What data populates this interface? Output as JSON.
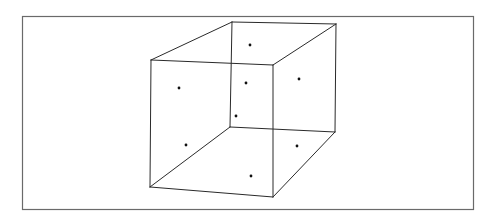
{
  "figure": {
    "colors": {
      "background": "#ffffff",
      "frame_stroke": "#6a6a6a",
      "edge_stroke": "#2a2a2a",
      "dot_fill": "#111111"
    },
    "frame": {
      "x": 22,
      "y": 16,
      "width": 451,
      "height": 193
    },
    "vertices": {
      "front_top_left": [
        151,
        60
      ],
      "front_top_right": [
        273,
        65
      ],
      "front_bottom_right": [
        273,
        197
      ],
      "front_bottom_left": [
        150,
        187
      ],
      "back_top_left": [
        232,
        22
      ],
      "back_top_right": [
        336,
        24
      ],
      "back_bottom_right": [
        335,
        132
      ],
      "back_bottom_left": [
        230,
        127
      ]
    },
    "edges": [
      [
        "front_top_left",
        "front_top_right"
      ],
      [
        "front_top_right",
        "front_bottom_right"
      ],
      [
        "front_bottom_right",
        "front_bottom_left"
      ],
      [
        "front_bottom_left",
        "front_top_left"
      ],
      [
        "back_top_left",
        "back_top_right"
      ],
      [
        "back_top_right",
        "back_bottom_right"
      ],
      [
        "back_bottom_right",
        "back_bottom_left"
      ],
      [
        "back_bottom_left",
        "back_top_left"
      ],
      [
        "front_top_left",
        "back_top_left"
      ],
      [
        "front_top_right",
        "back_top_right"
      ],
      [
        "front_bottom_right",
        "back_bottom_right"
      ],
      [
        "front_bottom_left",
        "back_bottom_left"
      ]
    ],
    "dots": [
      {
        "face": "top",
        "x": 250,
        "y": 45
      },
      {
        "face": "left",
        "x": 179,
        "y": 88
      },
      {
        "face": "front-upper",
        "x": 246,
        "y": 83
      },
      {
        "face": "right",
        "x": 299,
        "y": 79
      },
      {
        "face": "back",
        "x": 236,
        "y": 116
      },
      {
        "face": "left-lower",
        "x": 186,
        "y": 145
      },
      {
        "face": "right-lower",
        "x": 297,
        "y": 146
      },
      {
        "face": "bottom",
        "x": 251,
        "y": 176
      }
    ]
  }
}
